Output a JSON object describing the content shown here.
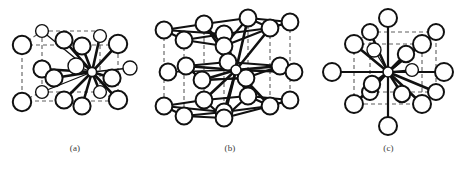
{
  "figure": {
    "background_color": "#ffffff",
    "line_color": "#111111",
    "cell_line_color": "#5e5e5e",
    "atom_fill_color": "#ffffff",
    "width": 467,
    "height": 171,
    "panels": [
      {
        "id": "a",
        "caption": "(a)",
        "structure_name": "face-centred cubic coordination",
        "coordination_number": 12,
        "cell_style": "dashed",
        "center_atom": {
          "cx": 92,
          "cy": 72,
          "r": 4.6
        },
        "atoms": [
          {
            "cx": 22,
            "cy": 45,
            "r": 9.2
          },
          {
            "cx": 22,
            "cy": 102,
            "r": 9.2
          },
          {
            "cx": 42,
            "cy": 31,
            "r": 6.4
          },
          {
            "cx": 42,
            "cy": 69,
            "r": 8.6
          },
          {
            "cx": 42,
            "cy": 92,
            "r": 6.4
          },
          {
            "cx": 54,
            "cy": 78,
            "r": 8.6
          },
          {
            "cx": 64,
            "cy": 40,
            "r": 8.6
          },
          {
            "cx": 64,
            "cy": 100,
            "r": 8.6
          },
          {
            "cx": 82,
            "cy": 46,
            "r": 8.6
          },
          {
            "cx": 82,
            "cy": 106,
            "r": 8.6
          },
          {
            "cx": 76,
            "cy": 66,
            "r": 8.0
          },
          {
            "cx": 100,
            "cy": 36,
            "r": 6.4
          },
          {
            "cx": 100,
            "cy": 92,
            "r": 6.4
          },
          {
            "cx": 118,
            "cy": 44,
            "r": 9.2
          },
          {
            "cx": 118,
            "cy": 100,
            "r": 9.2
          },
          {
            "cx": 112,
            "cy": 78,
            "r": 8.6
          },
          {
            "cx": 130,
            "cy": 68,
            "r": 7.0
          }
        ]
      },
      {
        "id": "b",
        "caption": "(b)",
        "structure_name": "hexagonal close-packed coordination",
        "coordination_number": 12,
        "cell_style": "dashed-vertical",
        "center_atom": {
          "cx": 72,
          "cy": 72,
          "r": 5.0
        },
        "layers": [
          "upper",
          "middle",
          "lower"
        ]
      },
      {
        "id": "c",
        "caption": "(c)",
        "structure_name": "body-centred cubic coordination",
        "coordination_number": 14,
        "cell_style": "dashed",
        "center_atom": {
          "cx": 72,
          "cy": 72,
          "r": 5.0
        },
        "atoms": [
          {
            "cx": 72,
            "cy": 18,
            "r": 9.0
          },
          {
            "cx": 72,
            "cy": 126,
            "r": 9.0
          },
          {
            "cx": 18,
            "cy": 72,
            "r": 9.0
          },
          {
            "cx": 126,
            "cy": 72,
            "r": 9.0
          },
          {
            "cx": 40,
            "cy": 42,
            "r": 9.0
          },
          {
            "cx": 104,
            "cy": 42,
            "r": 9.0
          },
          {
            "cx": 40,
            "cy": 102,
            "r": 9.0
          },
          {
            "cx": 104,
            "cy": 102,
            "r": 9.0
          },
          {
            "cx": 58,
            "cy": 36,
            "r": 7.2
          },
          {
            "cx": 90,
            "cy": 54,
            "r": 8.2
          },
          {
            "cx": 56,
            "cy": 84,
            "r": 8.2
          },
          {
            "cx": 86,
            "cy": 94,
            "r": 8.2
          },
          {
            "cx": 58,
            "cy": 104,
            "r": 7.2
          },
          {
            "cx": 96,
            "cy": 70,
            "r": 6.2
          }
        ]
      }
    ]
  }
}
